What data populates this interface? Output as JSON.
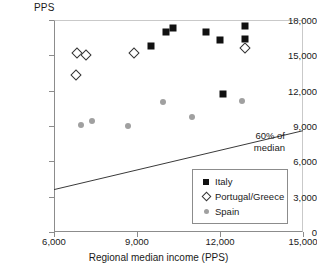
{
  "chart_data": {
    "type": "scatter",
    "title": "",
    "xlabel": "Regional median income (PPS)",
    "ylabel": "PPS",
    "xlim": [
      6000,
      15000
    ],
    "ylim": [
      0,
      18000
    ],
    "xticks": [
      "6,000",
      "9,000",
      "12,000",
      "15,000"
    ],
    "xtick_values": [
      6000,
      9000,
      12000,
      15000
    ],
    "yticks": [
      "0",
      "3,000",
      "6,000",
      "9,000",
      "12,000",
      "15,000",
      "18,000"
    ],
    "ytick_values": [
      0,
      3000,
      6000,
      9000,
      12000,
      15000,
      18000
    ],
    "grid": false,
    "legend_position": "lower-right",
    "series": [
      {
        "name": "Italy",
        "marker": "filled-square",
        "color": "#111111",
        "points": [
          {
            "x": 10050,
            "y": 17000
          },
          {
            "x": 10300,
            "y": 17300
          },
          {
            "x": 11500,
            "y": 17000
          },
          {
            "x": 12000,
            "y": 16300
          },
          {
            "x": 12900,
            "y": 17500
          },
          {
            "x": 12900,
            "y": 16400
          },
          {
            "x": 9500,
            "y": 15800
          },
          {
            "x": 12100,
            "y": 11700
          }
        ]
      },
      {
        "name": "Portugal/Greece",
        "marker": "open-diamond",
        "color": "#333333",
        "points": [
          {
            "x": 6800,
            "y": 13300
          },
          {
            "x": 6840,
            "y": 15200
          },
          {
            "x": 7150,
            "y": 15050
          },
          {
            "x": 8900,
            "y": 15200
          },
          {
            "x": 12900,
            "y": 15600
          }
        ]
      },
      {
        "name": "Spain",
        "marker": "filled-circle",
        "color": "#a0a0a0",
        "points": [
          {
            "x": 6980,
            "y": 9100
          },
          {
            "x": 7370,
            "y": 9450
          },
          {
            "x": 8670,
            "y": 9000
          },
          {
            "x": 9930,
            "y": 11000
          },
          {
            "x": 11000,
            "y": 9800
          },
          {
            "x": 12800,
            "y": 11100
          }
        ]
      }
    ],
    "reference_line": {
      "label_line1": "60% of",
      "label_line2": "median",
      "x_start": 6000,
      "y_start": 3600,
      "x_end": 15000,
      "y_end": 8600
    }
  }
}
